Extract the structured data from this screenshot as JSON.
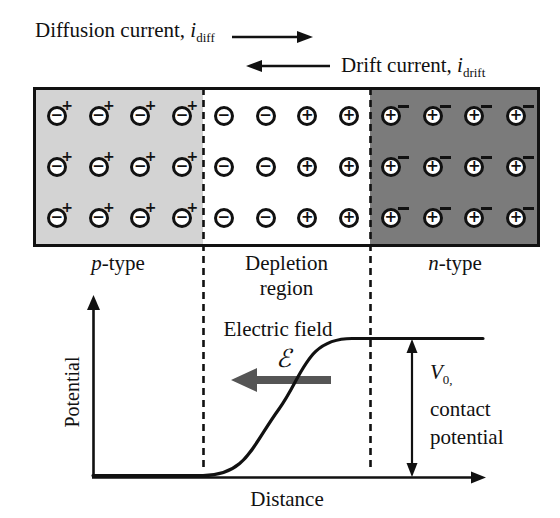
{
  "currents": {
    "diffusion": {
      "text": "Diffusion current, ",
      "symbol": "i",
      "subscript": "diff"
    },
    "drift": {
      "text": "Drift current, ",
      "symbol": "i",
      "subscript": "drift"
    }
  },
  "junction": {
    "rows": 3,
    "glyphs": {
      "plus": "+",
      "minus": "−"
    },
    "regions": [
      {
        "name": "p-type",
        "label_prefix": "p",
        "label_suffix": "-type",
        "bg": "#d3d3d3",
        "cells": [
          {
            "ion": "minus",
            "carrier": "plus"
          },
          {
            "ion": "minus",
            "carrier": "plus"
          },
          {
            "ion": "minus",
            "carrier": "plus"
          },
          {
            "ion": "minus",
            "carrier": "plus"
          }
        ]
      },
      {
        "name": "depletion",
        "label_line1": "Depletion",
        "label_line2": "region",
        "bg": "#ffffff",
        "cells": [
          {
            "ion": "minus"
          },
          {
            "ion": "minus"
          },
          {
            "ion": "plus"
          },
          {
            "ion": "plus"
          }
        ]
      },
      {
        "name": "n-type",
        "label_prefix": "n",
        "label_suffix": "-type",
        "bg": "#7b7b7b",
        "cells": [
          {
            "ion": "plus",
            "carrier": "minus"
          },
          {
            "ion": "plus",
            "carrier": "minus"
          },
          {
            "ion": "plus",
            "carrier": "minus"
          },
          {
            "ion": "plus",
            "carrier": "minus"
          }
        ]
      }
    ]
  },
  "plot": {
    "ylabel": "Potential",
    "xlabel": "Distance",
    "efield_label": "Electric field",
    "efield_symbol": "ℰ",
    "v0_symbol": "V",
    "v0_subscript": "0,",
    "v0_line2": "contact",
    "v0_line3": "potential"
  },
  "colors": {
    "p_region_bg": "#d3d3d3",
    "depletion_bg": "#ffffff",
    "n_region_bg": "#7b7b7b",
    "line": "#111111",
    "efield_arrow": "#555555"
  }
}
